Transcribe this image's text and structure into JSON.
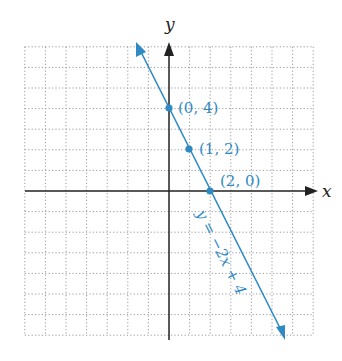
{
  "chart_data": {
    "type": "line",
    "title": "",
    "xlabel": "x",
    "ylabel": "y",
    "xlim": [
      -7,
      7
    ],
    "ylim": [
      -7,
      7
    ],
    "grid": true,
    "grid_style": "dotted",
    "series": [
      {
        "name": "y = −2x + 4",
        "slope": -2,
        "intercept": 4,
        "color": "#2f8ac4"
      }
    ],
    "points": [
      {
        "x": 0,
        "y": 4,
        "label": "(0, 4)"
      },
      {
        "x": 1,
        "y": 2,
        "label": "(1, 2)"
      },
      {
        "x": 2,
        "y": 0,
        "label": "(2, 0)"
      }
    ],
    "annotations": [
      {
        "text": "y = −2x + 4",
        "rotated": true
      }
    ]
  },
  "labels": {
    "x_axis": "x",
    "y_axis": "y",
    "equation": "y = −2x + 4",
    "p0": "(0, 4)",
    "p1": "(1, 2)",
    "p2": "(2, 0)"
  },
  "colors": {
    "line": "#2f8ac4",
    "axis": "#222222",
    "grid": "#9a9a9a"
  }
}
